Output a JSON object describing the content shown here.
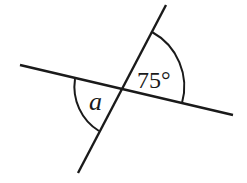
{
  "diagram": {
    "type": "intersecting-lines-angles",
    "labels": {
      "angle_known": "75°",
      "angle_unknown": "a"
    },
    "colors": {
      "stroke": "#1a1a1a",
      "background": "#ffffff"
    }
  }
}
